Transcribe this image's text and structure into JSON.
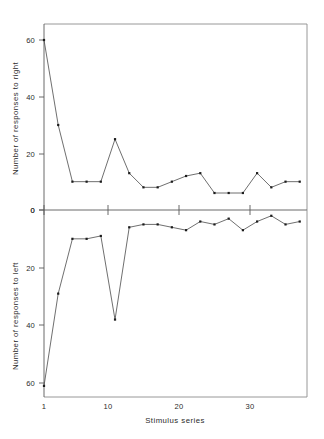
{
  "figure": {
    "background_color": "#ffffff",
    "line_color": "#4a4a4a",
    "point_color": "#1c1c1c",
    "axis_color": "#5a5a5a",
    "x_axis_title": "Stimulus series"
  },
  "chart_data": [
    {
      "type": "line",
      "title": "",
      "panel": "top",
      "xlabel": "Stimulus series",
      "ylabel": "Number of responses to right",
      "xlim": [
        1,
        38
      ],
      "ylim": [
        0,
        66
      ],
      "y_inverted": false,
      "grid": false,
      "legend": "none",
      "xticks": [
        1,
        10,
        20,
        30
      ],
      "xtick_labels": [
        "1",
        "10",
        "20",
        "30"
      ],
      "yticks": [
        0,
        20,
        40,
        60
      ],
      "ytick_labels": [
        "0",
        "20",
        "40",
        "60"
      ],
      "x": [
        1,
        3,
        5,
        7,
        9,
        11,
        13,
        15,
        17,
        19,
        21,
        23,
        25,
        27,
        29,
        31,
        33,
        35,
        37
      ],
      "values": [
        60,
        30,
        10,
        10,
        10,
        25,
        13,
        8,
        8,
        10,
        12,
        13,
        6,
        6,
        6,
        13,
        8,
        10,
        10
      ]
    },
    {
      "type": "line",
      "title": "",
      "panel": "bottom",
      "xlabel": "Stimulus series",
      "ylabel": "Number of responses to left",
      "xlim": [
        1,
        38
      ],
      "ylim": [
        0,
        66
      ],
      "y_inverted": true,
      "grid": false,
      "legend": "none",
      "xticks": [
        1,
        10,
        20,
        30
      ],
      "xtick_labels": [
        "1",
        "10",
        "20",
        "30"
      ],
      "yticks": [
        0,
        20,
        40,
        60
      ],
      "ytick_labels": [
        "0",
        "20",
        "40",
        "60"
      ],
      "x": [
        1,
        3,
        5,
        7,
        9,
        11,
        13,
        15,
        17,
        19,
        21,
        23,
        25,
        27,
        29,
        31,
        33,
        35,
        37
      ],
      "values": [
        61,
        29,
        10,
        10,
        9,
        38,
        6,
        5,
        5,
        6,
        7,
        4,
        5,
        3,
        7,
        4,
        2,
        5,
        4
      ]
    }
  ],
  "top_panel": {
    "y_axis_label": "Number of responses to right",
    "y_tick_labels": [
      "60",
      "40",
      "20",
      "0"
    ]
  },
  "bottom_panel": {
    "y_axis_label": "Number of responses to left",
    "y_tick_labels": [
      "0",
      "20",
      "40",
      "60"
    ]
  },
  "x_axis": {
    "title": "Stimulus series",
    "tick_labels": [
      "1",
      "10",
      "20",
      "30"
    ]
  }
}
